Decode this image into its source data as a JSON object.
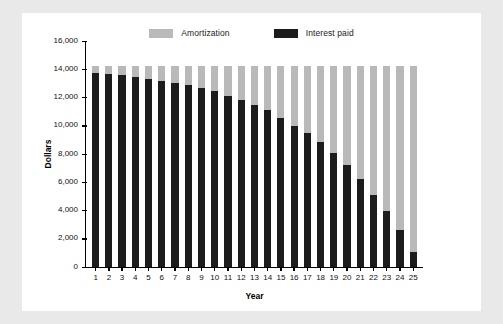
{
  "chart_data": {
    "type": "bar",
    "stacked": true,
    "title": "",
    "subtitle": "",
    "xlabel": "Year",
    "ylabel": "Dollars",
    "categories": [
      "1",
      "2",
      "3",
      "4",
      "5",
      "6",
      "7",
      "8",
      "9",
      "10",
      "11",
      "12",
      "13",
      "14",
      "15",
      "16",
      "17",
      "18",
      "19",
      "20",
      "21",
      "22",
      "23",
      "24",
      "25"
    ],
    "ylim": [
      0,
      16000
    ],
    "yticks": [
      0,
      2000,
      4000,
      6000,
      8000,
      10000,
      12000,
      14000,
      16000
    ],
    "ytick_labels": [
      "0",
      "2,000",
      "4,000",
      "6,000",
      "8,000",
      "10,000",
      "12,000",
      "14,000",
      "16,000"
    ],
    "grid": false,
    "legend_position": "top-center",
    "annual_payment": 14200,
    "series": [
      {
        "name": "Interest paid",
        "color": "#1c1c1c",
        "values": [
          13670,
          13570,
          13500,
          13380,
          13250,
          13130,
          12980,
          12820,
          12620,
          12400,
          12070,
          11800,
          11450,
          11070,
          10520,
          9970,
          9480,
          8790,
          8030,
          7200,
          6180,
          5100,
          3960,
          2620,
          1060
        ]
      },
      {
        "name": "Amortization",
        "color": "#b9b9b9",
        "values": [
          530,
          630,
          700,
          820,
          950,
          1070,
          1220,
          1380,
          1580,
          1800,
          2130,
          2400,
          2750,
          3130,
          3680,
          4230,
          4720,
          5410,
          6170,
          7000,
          8020,
          9100,
          10240,
          11580,
          13140
        ]
      }
    ],
    "legend": [
      {
        "label": "Amortization",
        "color": "#b9b9b9"
      },
      {
        "label": "Interest paid",
        "color": "#1c1c1c"
      }
    ]
  }
}
